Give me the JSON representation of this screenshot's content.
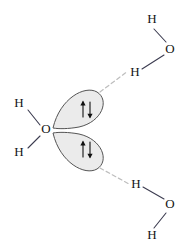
{
  "figure": {
    "width": 189,
    "height": 249,
    "background_color": "#ffffff"
  },
  "colors": {
    "atom_text": "#141414",
    "covalent_bond": "#3c3c50",
    "hydrogen_bond": "#bdbdbd",
    "lobe_fill": "#ebebeb",
    "lobe_stroke": "#545454",
    "arrow": "#111111"
  },
  "molecules": {
    "central": {
      "name": "central-water-molecule",
      "oxygen": {
        "label": "O",
        "x": 46,
        "y": 130
      },
      "hydrogens": [
        {
          "label": "H",
          "x": 19,
          "y": 104
        },
        {
          "label": "H",
          "x": 19,
          "y": 153
        }
      ]
    },
    "upper_right": {
      "name": "upper-right-water-molecule",
      "oxygen": {
        "label": "O",
        "x": 170,
        "y": 50
      },
      "hydrogens": [
        {
          "label": "H",
          "x": 152,
          "y": 20
        },
        {
          "label": "H",
          "x": 135,
          "y": 73
        }
      ]
    },
    "lower_right": {
      "name": "lower-right-water-molecule",
      "oxygen": {
        "label": "O",
        "x": 170,
        "y": 205
      },
      "hydrogens": [
        {
          "label": "H",
          "x": 136,
          "y": 185
        },
        {
          "label": "H",
          "x": 152,
          "y": 236
        }
      ]
    }
  },
  "lone_pairs": [
    {
      "name": "upper-lone-pair",
      "electron_arrows": "↑↓",
      "arrow_x": 87,
      "arrow_y": 110,
      "label": "lone pair"
    },
    {
      "name": "lower-lone-pair",
      "electron_arrows": "↑↓",
      "arrow_x": 87,
      "arrow_y": 150,
      "label": "lone pair"
    }
  ],
  "hydrogen_bonds": [
    {
      "name": "upper-hydrogen-bond",
      "from": "upper-lone-pair",
      "to": "upper-right-water-molecule",
      "style": "dashed"
    },
    {
      "name": "lower-hydrogen-bond",
      "from": "lower-lone-pair",
      "to": "lower-right-water-molecule",
      "style": "dashed"
    }
  ]
}
